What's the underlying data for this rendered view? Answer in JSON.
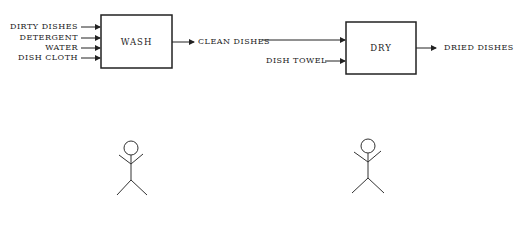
{
  "diagram": {
    "processes": [
      {
        "id": "wash",
        "label": "WASH",
        "inputs": [
          "DIRTY DISHES",
          "DETERGENT",
          "WATER",
          "DISH CLOTH"
        ],
        "output": "CLEAN DISHES"
      },
      {
        "id": "dry",
        "label": "DRY",
        "inputs": [
          "CLEAN DISHES",
          "DISH TOWEL"
        ],
        "output": "DRIED DISHES"
      }
    ],
    "actors": [
      {
        "id": "actor-1",
        "icon": "stick-figure-icon"
      },
      {
        "id": "actor-2",
        "icon": "stick-figure-icon"
      }
    ],
    "line_color": "#222222"
  }
}
